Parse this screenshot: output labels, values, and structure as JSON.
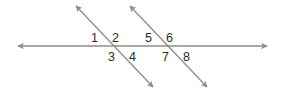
{
  "figure": {
    "colors": {
      "line": "#8c8c8c",
      "label": "#2b2b2b",
      "background": "#ffffff"
    },
    "lines": [
      {
        "id": "horizontal",
        "x1": 18,
        "y1": 46,
        "x2": 267,
        "y2": 46,
        "arrows": "both"
      },
      {
        "id": "transversal-left",
        "x1": 76,
        "y1": 6,
        "x2": 153,
        "y2": 87,
        "arrows": "both"
      },
      {
        "id": "transversal-right",
        "x1": 130,
        "y1": 6,
        "x2": 207,
        "y2": 87,
        "arrows": "both"
      }
    ],
    "angle_labels": [
      {
        "text": "1",
        "x": 91,
        "y": 42
      },
      {
        "text": "2",
        "x": 112,
        "y": 42
      },
      {
        "text": "3",
        "x": 108,
        "y": 61
      },
      {
        "text": "4",
        "x": 129,
        "y": 61
      },
      {
        "text": "5",
        "x": 145,
        "y": 42
      },
      {
        "text": "6",
        "x": 166,
        "y": 42
      },
      {
        "text": "7",
        "x": 162,
        "y": 61
      },
      {
        "text": "8",
        "x": 183,
        "y": 61
      }
    ]
  }
}
